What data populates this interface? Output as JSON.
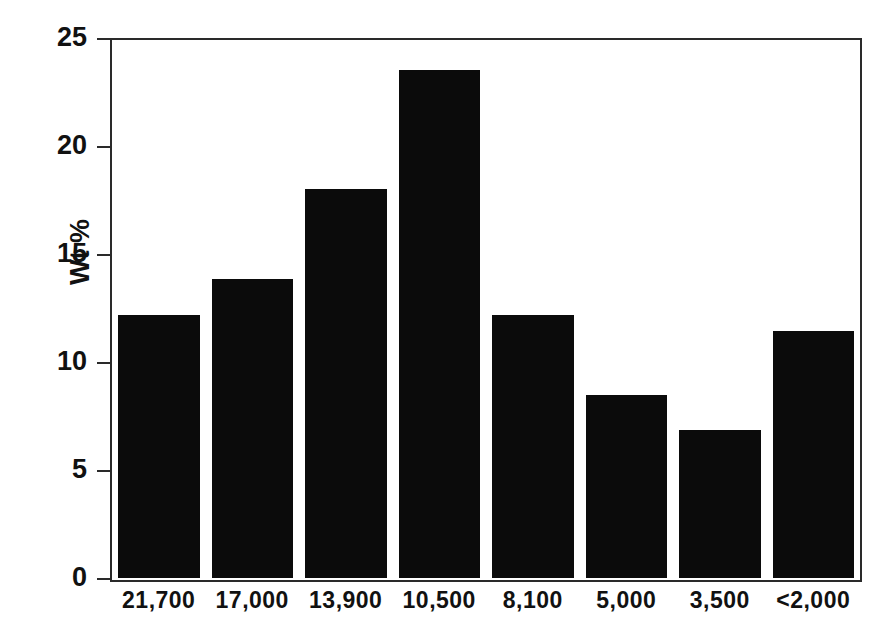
{
  "chart_data": {
    "type": "bar",
    "title": "",
    "xlabel": "",
    "ylabel": "Wt %",
    "categories": [
      "21,700",
      "17,000",
      "13,900",
      "10,500",
      "8,100",
      "5,000",
      "3,500",
      "<2,000"
    ],
    "values": [
      12.2,
      13.9,
      18.1,
      23.6,
      12.2,
      8.5,
      6.9,
      11.5
    ],
    "ylim": [
      0,
      25
    ],
    "yticks": [
      0,
      5,
      10,
      15,
      20,
      25
    ],
    "ytick_labels": [
      "0",
      "5",
      "10",
      "15",
      "20",
      "25"
    ],
    "grid": false,
    "legend": null,
    "bar_color": "#0b0b0b",
    "axis_color": "#2a2a2a",
    "background": "#ffffff"
  }
}
